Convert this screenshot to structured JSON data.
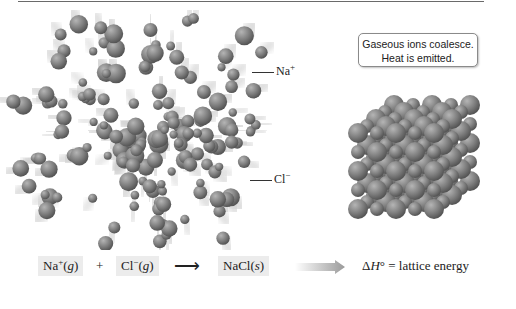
{
  "figure": {
    "callout": {
      "line1": "Gaseous ions coalesce.",
      "line2": "Heat is emitted."
    },
    "labels": {
      "na_label": "Na",
      "na_charge": "+",
      "cl_label": "Cl",
      "cl_charge": "−"
    },
    "equation": {
      "reactant1_symbol": "Na",
      "reactant1_charge": "+",
      "reactant1_state": "g",
      "plus": "+",
      "reactant2_symbol": "Cl",
      "reactant2_charge": "−",
      "reactant2_state": "g",
      "arrow": "⟶",
      "product_symbol": "NaCl",
      "product_state": "s",
      "delta_symbol": "Δ",
      "enthalpy_symbol": "H",
      "degree": "°",
      "equals_text": " = lattice energy"
    },
    "colors": {
      "sphere": "#7d7d7d",
      "sphere_highlight": "#b8b8b8",
      "label_box": "#ececec",
      "rule": "#6a6a6a"
    }
  }
}
